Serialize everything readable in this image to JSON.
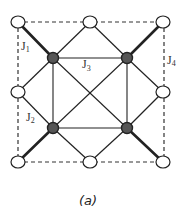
{
  "diagram": {
    "caption": "(a)",
    "labels": {
      "j1": {
        "main": "J",
        "sub": "1"
      },
      "j2": {
        "main": "J",
        "sub": "2"
      },
      "j3": {
        "main": "J",
        "sub": "3"
      },
      "j4": {
        "main": "J",
        "sub": "4"
      }
    },
    "colors": {
      "line": "#222222",
      "open_node_fill": "#ffffff",
      "filled_node_fill": "#555555",
      "dashed": "#333333"
    },
    "nodes": {
      "open": [
        "top-left",
        "top-mid",
        "top-right",
        "left-mid",
        "right-mid",
        "bottom-left",
        "bottom-mid",
        "bottom-right"
      ],
      "filled": [
        "inner-top-left",
        "inner-top-right",
        "inner-bottom-left",
        "inner-bottom-right"
      ]
    }
  }
}
